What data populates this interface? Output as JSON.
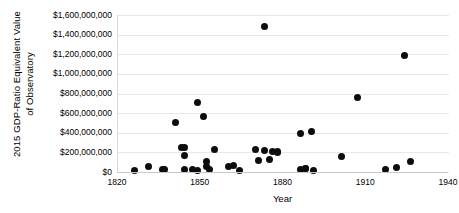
{
  "chart_data": {
    "type": "scatter",
    "title": "",
    "xlabel": "Year",
    "ylabel": "2015 GDP-Ratio Equivalent Value\nof Observatory",
    "xlim": [
      1820,
      1940
    ],
    "ylim": [
      0,
      1600000000
    ],
    "grid": true,
    "legend": "none",
    "xticks": [
      1820,
      1850,
      1880,
      1910,
      1940
    ],
    "xtick_labels": [
      "1820",
      "1850",
      "1880",
      "1910",
      "1940"
    ],
    "yticks": [
      0,
      200000000,
      400000000,
      600000000,
      800000000,
      1000000000,
      1200000000,
      1400000000,
      1600000000
    ],
    "ytick_labels": [
      "$0",
      "$200,000,000",
      "$400,000,000",
      "$600,000,000",
      "$800,000,000",
      "$1,000,000,000",
      "$1,200,000,000",
      "$1,400,000,000",
      "$1,600,000,000"
    ],
    "marker": {
      "shape": "circle",
      "color": "#0d0d0d",
      "size": 7
    },
    "points": [
      {
        "x": 1826,
        "y": 20000000
      },
      {
        "x": 1831,
        "y": 55000000
      },
      {
        "x": 1836,
        "y": 25000000
      },
      {
        "x": 1837,
        "y": 25000000
      },
      {
        "x": 1841,
        "y": 500000000
      },
      {
        "x": 1843,
        "y": 245000000
      },
      {
        "x": 1844,
        "y": 250000000
      },
      {
        "x": 1844,
        "y": 170000000
      },
      {
        "x": 1844,
        "y": 25000000
      },
      {
        "x": 1847,
        "y": 25000000
      },
      {
        "x": 1849,
        "y": 20000000
      },
      {
        "x": 1849,
        "y": 710000000
      },
      {
        "x": 1851,
        "y": 570000000
      },
      {
        "x": 1852,
        "y": 105000000
      },
      {
        "x": 1852,
        "y": 60000000
      },
      {
        "x": 1853,
        "y": 25000000
      },
      {
        "x": 1855,
        "y": 225000000
      },
      {
        "x": 1860,
        "y": 55000000
      },
      {
        "x": 1862,
        "y": 65000000
      },
      {
        "x": 1864,
        "y": 20000000
      },
      {
        "x": 1870,
        "y": 225000000
      },
      {
        "x": 1871,
        "y": 120000000
      },
      {
        "x": 1873,
        "y": 215000000
      },
      {
        "x": 1873,
        "y": 1480000000
      },
      {
        "x": 1875,
        "y": 130000000
      },
      {
        "x": 1876,
        "y": 205000000
      },
      {
        "x": 1878,
        "y": 195000000
      },
      {
        "x": 1878,
        "y": 205000000
      },
      {
        "x": 1886,
        "y": 390000000
      },
      {
        "x": 1886,
        "y": 25000000
      },
      {
        "x": 1888,
        "y": 35000000
      },
      {
        "x": 1888,
        "y": 40000000
      },
      {
        "x": 1890,
        "y": 410000000
      },
      {
        "x": 1891,
        "y": 20000000
      },
      {
        "x": 1901,
        "y": 155000000
      },
      {
        "x": 1907,
        "y": 760000000
      },
      {
        "x": 1917,
        "y": 30000000
      },
      {
        "x": 1921,
        "y": 45000000
      },
      {
        "x": 1924,
        "y": 1190000000
      },
      {
        "x": 1926,
        "y": 105000000
      }
    ]
  }
}
